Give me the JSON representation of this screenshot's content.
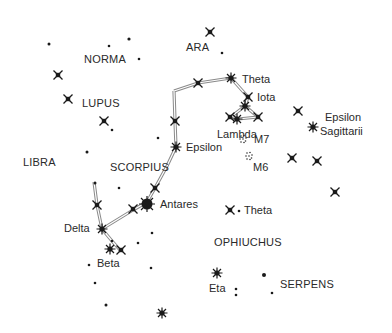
{
  "chart": {
    "constellations": [
      "NORMA",
      "ARA",
      "LUPUS",
      "LIBRA",
      "SCORPIUS",
      "OPHIUCHUS",
      "SERPENS"
    ],
    "stars": [
      "Theta",
      "Iota",
      "Lambda",
      "Epsilon",
      "Epsilon Sagittarii",
      "Antares",
      "Delta",
      "Beta",
      "Theta",
      "Eta"
    ],
    "clusters": [
      "M7",
      "M6"
    ]
  },
  "labels": {
    "norma": "NORMA",
    "ara": "ARA",
    "lupus": "LUPUS",
    "libra": "LIBRA",
    "scorpius": "SCORPIUS",
    "ophiuchus": "OPHIUCHUS",
    "serpens": "SERPENS",
    "theta_sco": "Theta",
    "iota": "Iota",
    "lambda": "Lambda",
    "m7": "M7",
    "m6": "M6",
    "epsilon_sco": "Epsilon",
    "epsilon_sgr_1": "Epsilon",
    "epsilon_sgr_2": "Sagittarii",
    "antares": "Antares",
    "delta": "Delta",
    "beta": "Beta",
    "theta_oph": "Theta",
    "eta": "Eta"
  },
  "colors": {
    "ink": "#1a1a1a",
    "line": "#9a9a9a",
    "bg": "#ffffff"
  }
}
